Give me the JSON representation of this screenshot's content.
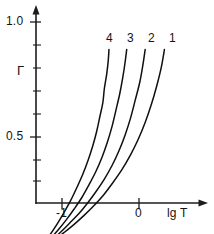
{
  "chart_data": {
    "type": "line",
    "title": "",
    "subtitle": "",
    "xlabel": "lg T",
    "ylabel": "Γ",
    "xlim": [
      -1.45,
      0.9
    ],
    "ylim": [
      0.0,
      1.06
    ],
    "grid": false,
    "legend_position": "inline-curve-labels",
    "x_ticks": [
      -1,
      0
    ],
    "x_tick_labels": [
      "-1",
      "0"
    ],
    "y_ticks": [
      0.5,
      1.0
    ],
    "y_tick_labels": [
      "0.5",
      "1.0"
    ],
    "y_minor_tick_step": 0.1,
    "axes_style": "arrow-ended open axes",
    "annotations": [
      {
        "text": "4",
        "x": -0.37,
        "y": 0.92
      },
      {
        "text": "3",
        "x": -0.11,
        "y": 0.92
      },
      {
        "text": "2",
        "x": 0.16,
        "y": 0.92
      },
      {
        "text": "1",
        "x": 0.42,
        "y": 0.92
      }
    ],
    "series": [
      {
        "name": "4",
        "label": "4",
        "color": "#101010",
        "points": [
          {
            "x": -1.31,
            "y": 0.0
          },
          {
            "x": -1.24,
            "y": 0.035
          },
          {
            "x": -1.16,
            "y": 0.073
          },
          {
            "x": -1.07,
            "y": 0.118
          },
          {
            "x": -0.98,
            "y": 0.168
          },
          {
            "x": -0.89,
            "y": 0.222
          },
          {
            "x": -0.81,
            "y": 0.278
          },
          {
            "x": -0.73,
            "y": 0.338
          },
          {
            "x": -0.66,
            "y": 0.4
          },
          {
            "x": -0.6,
            "y": 0.462
          },
          {
            "x": -0.55,
            "y": 0.524
          },
          {
            "x": -0.51,
            "y": 0.586
          },
          {
            "x": -0.47,
            "y": 0.648
          },
          {
            "x": -0.45,
            "y": 0.71
          },
          {
            "x": -0.42,
            "y": 0.772
          },
          {
            "x": -0.4,
            "y": 0.83
          },
          {
            "x": -0.39,
            "y": 0.88
          }
        ]
      },
      {
        "name": "3",
        "label": "3",
        "color": "#101010",
        "points": [
          {
            "x": -1.31,
            "y": 0.0
          },
          {
            "x": -1.23,
            "y": 0.029
          },
          {
            "x": -1.14,
            "y": 0.062
          },
          {
            "x": -1.04,
            "y": 0.1
          },
          {
            "x": -0.94,
            "y": 0.142
          },
          {
            "x": -0.84,
            "y": 0.188
          },
          {
            "x": -0.74,
            "y": 0.238
          },
          {
            "x": -0.65,
            "y": 0.292
          },
          {
            "x": -0.56,
            "y": 0.35
          },
          {
            "x": -0.48,
            "y": 0.412
          },
          {
            "x": -0.41,
            "y": 0.478
          },
          {
            "x": -0.35,
            "y": 0.546
          },
          {
            "x": -0.3,
            "y": 0.616
          },
          {
            "x": -0.25,
            "y": 0.688
          },
          {
            "x": -0.21,
            "y": 0.76
          },
          {
            "x": -0.18,
            "y": 0.826
          },
          {
            "x": -0.16,
            "y": 0.88
          }
        ]
      },
      {
        "name": "2",
        "label": "2",
        "color": "#101010",
        "points": [
          {
            "x": -1.31,
            "y": 0.0
          },
          {
            "x": -1.22,
            "y": 0.026
          },
          {
            "x": -1.12,
            "y": 0.055
          },
          {
            "x": -1.01,
            "y": 0.089
          },
          {
            "x": -0.9,
            "y": 0.126
          },
          {
            "x": -0.78,
            "y": 0.167
          },
          {
            "x": -0.67,
            "y": 0.212
          },
          {
            "x": -0.56,
            "y": 0.262
          },
          {
            "x": -0.45,
            "y": 0.317
          },
          {
            "x": -0.35,
            "y": 0.376
          },
          {
            "x": -0.26,
            "y": 0.44
          },
          {
            "x": -0.18,
            "y": 0.509
          },
          {
            "x": -0.11,
            "y": 0.582
          },
          {
            "x": -0.05,
            "y": 0.659
          },
          {
            "x": 0.01,
            "y": 0.738
          },
          {
            "x": 0.05,
            "y": 0.812
          },
          {
            "x": 0.08,
            "y": 0.88
          }
        ]
      },
      {
        "name": "1",
        "label": "1",
        "color": "#101010",
        "points": [
          {
            "x": -1.31,
            "y": 0.0
          },
          {
            "x": -1.21,
            "y": 0.024
          },
          {
            "x": -1.1,
            "y": 0.051
          },
          {
            "x": -0.98,
            "y": 0.083
          },
          {
            "x": -0.85,
            "y": 0.118
          },
          {
            "x": -0.72,
            "y": 0.157
          },
          {
            "x": -0.59,
            "y": 0.2
          },
          {
            "x": -0.46,
            "y": 0.248
          },
          {
            "x": -0.34,
            "y": 0.301
          },
          {
            "x": -0.22,
            "y": 0.359
          },
          {
            "x": -0.11,
            "y": 0.422
          },
          {
            "x": -0.01,
            "y": 0.49
          },
          {
            "x": 0.08,
            "y": 0.563
          },
          {
            "x": 0.16,
            "y": 0.641
          },
          {
            "x": 0.23,
            "y": 0.722
          },
          {
            "x": 0.29,
            "y": 0.804
          },
          {
            "x": 0.33,
            "y": 0.88
          }
        ]
      }
    ]
  },
  "axes": {
    "y_tick_label_top": "1.0",
    "y_tick_label_mid": "0.5",
    "y_axis_title": "Γ",
    "x_tick_label_neg1": "-1",
    "x_tick_label_zero": "0",
    "x_axis_title": "lg T"
  },
  "curve_labels": {
    "four": "4",
    "three": "3",
    "two": "2",
    "one": "1"
  },
  "colors": {
    "curve": "#101010",
    "axis": "#1c1c1c",
    "background": "#ffffff",
    "text": "#141414"
  }
}
